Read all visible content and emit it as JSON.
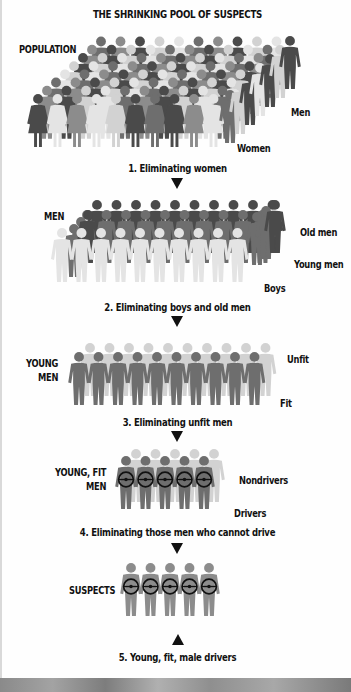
{
  "title": "THE SHRINKING POOL OF SUSPECTS",
  "colors": {
    "dark": "#4a4a4a",
    "mid": "#6e6e6e",
    "gray": "#8c8c8c",
    "light": "#d2d2d2",
    "lighter": "#e4e4e4",
    "wheel": "#111111",
    "text": "#111111"
  },
  "stages": [
    {
      "group_label": "POPULATION",
      "side_labels": [
        "Men",
        "Women"
      ],
      "caption": "1. Eliminating women"
    },
    {
      "group_label": "MEN",
      "side_labels": [
        "Old men",
        "Young men",
        "Boys"
      ],
      "caption": "2. Eliminating boys and old men"
    },
    {
      "group_label_lines": [
        "YOUNG",
        "MEN"
      ],
      "side_labels": [
        "Unfit",
        "Fit"
      ],
      "caption": "3. Eliminating unfit men"
    },
    {
      "group_label_lines": [
        "YOUNG, FIT",
        "MEN"
      ],
      "side_labels": [
        "Nondrivers",
        "Drivers"
      ],
      "caption": "4. Eliminating those men who cannot drive"
    },
    {
      "group_label": "SUSPECTS",
      "side_labels": [],
      "caption": "5. Young, fit, male drivers"
    }
  ],
  "figure_counts": {
    "stage1_front_women": 10,
    "stage2_front_boys": 10,
    "stage3_front_fit": 10,
    "stage4_drivers": 5,
    "stage5_suspects": 5
  }
}
